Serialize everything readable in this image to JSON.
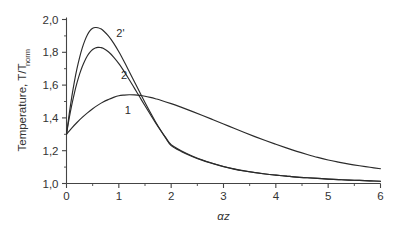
{
  "chart_data": {
    "type": "line",
    "title": "",
    "xlabel": "αz",
    "ylabel": "Temperature, T/T",
    "ylabel_subscript": "norm",
    "xlim": [
      0,
      6
    ],
    "ylim": [
      1.0,
      2.0
    ],
    "grid": false,
    "legend": "inline-curve-labels",
    "x_ticks": [
      "0",
      "1",
      "2",
      "3",
      "4",
      "5",
      "6"
    ],
    "x_tick_values": [
      0,
      1,
      2,
      3,
      4,
      5,
      6
    ],
    "x_minor_tick_values": [
      0.5,
      1.5,
      2.5,
      3.5,
      4.5,
      5.5
    ],
    "y_ticks": [
      "1,0",
      "1,2",
      "1,4",
      "1,6",
      "1,8",
      "2,0"
    ],
    "y_tick_values": [
      1.0,
      1.2,
      1.4,
      1.6,
      1.8,
      2.0
    ],
    "y_minor_tick_values": [
      1.1,
      1.3,
      1.5,
      1.7,
      1.9
    ],
    "series": [
      {
        "name": "1",
        "label": "1",
        "label_x": 1.17,
        "label_y": 1.425,
        "peak_x": 1.05,
        "peak_y": 1.54,
        "start_y": 1.3,
        "end_y": 1.09,
        "x": [
          0.0,
          0.1,
          0.2,
          0.3,
          0.4,
          0.5,
          0.6,
          0.7,
          0.8,
          0.9,
          1.0,
          1.1,
          1.2,
          1.3,
          1.4,
          1.5,
          1.6,
          1.7,
          1.8,
          2.0,
          2.2,
          2.4,
          2.6,
          2.8,
          3.0,
          3.2,
          3.4,
          3.6,
          3.8,
          4.0,
          4.2,
          4.4,
          4.6,
          4.8,
          5.0,
          5.2,
          5.4,
          5.6,
          5.8,
          6.0
        ],
        "y": [
          1.3,
          1.338,
          1.372,
          1.403,
          1.431,
          1.456,
          1.478,
          1.497,
          1.512,
          1.525,
          1.535,
          1.539,
          1.541,
          1.54,
          1.537,
          1.532,
          1.525,
          1.517,
          1.508,
          1.487,
          1.464,
          1.44,
          1.415,
          1.389,
          1.363,
          1.337,
          1.311,
          1.286,
          1.262,
          1.239,
          1.217,
          1.196,
          1.177,
          1.159,
          1.143,
          1.13,
          1.118,
          1.108,
          1.099,
          1.09
        ]
      },
      {
        "name": "2",
        "label": "2",
        "label_x": 1.1,
        "label_y": 1.635,
        "peak_x": 0.58,
        "peak_y": 1.83,
        "start_y": 1.3,
        "end_y": 1.01,
        "x": [
          0.0,
          0.05,
          0.1,
          0.15,
          0.2,
          0.25,
          0.3,
          0.35,
          0.4,
          0.45,
          0.5,
          0.55,
          0.6,
          0.65,
          0.7,
          0.8,
          0.9,
          1.0,
          1.1,
          1.2,
          1.3,
          1.4,
          1.5,
          1.6,
          1.7,
          1.8,
          1.9,
          2.0,
          2.2,
          2.4,
          2.6,
          2.8,
          3.0,
          3.2,
          3.4,
          3.6,
          3.8,
          4.0,
          4.2,
          4.4,
          4.6,
          4.8,
          5.0,
          5.2,
          5.4,
          5.6,
          5.8,
          6.0
        ],
        "y": [
          1.3,
          1.395,
          1.478,
          1.55,
          1.613,
          1.667,
          1.712,
          1.749,
          1.779,
          1.801,
          1.817,
          1.826,
          1.83,
          1.829,
          1.824,
          1.803,
          1.771,
          1.731,
          1.684,
          1.633,
          1.58,
          1.527,
          1.474,
          1.422,
          1.371,
          1.323,
          1.278,
          1.236,
          1.198,
          1.168,
          1.143,
          1.122,
          1.104,
          1.089,
          1.077,
          1.067,
          1.058,
          1.051,
          1.045,
          1.039,
          1.035,
          1.031,
          1.027,
          1.024,
          1.021,
          1.019,
          1.016,
          1.014
        ]
      },
      {
        "name": "2'",
        "label": "2'",
        "label_x": 1.03,
        "label_y": 1.895,
        "peak_x": 0.58,
        "peak_y": 1.95,
        "start_y": 1.3,
        "end_y": 1.01,
        "x": [
          0.0,
          0.05,
          0.1,
          0.15,
          0.2,
          0.25,
          0.3,
          0.35,
          0.4,
          0.45,
          0.5,
          0.55,
          0.6,
          0.65,
          0.7,
          0.8,
          0.9,
          1.0,
          1.1,
          1.2,
          1.3,
          1.4,
          1.5,
          1.6,
          1.7,
          1.8,
          1.9,
          2.0,
          2.2,
          2.4,
          2.6,
          2.8,
          3.0,
          3.2,
          3.4,
          3.6,
          3.8,
          4.0,
          4.2,
          4.4,
          4.6,
          4.8,
          5.0,
          5.2,
          5.4,
          5.6,
          5.8,
          6.0
        ],
        "y": [
          1.3,
          1.42,
          1.527,
          1.62,
          1.7,
          1.768,
          1.825,
          1.871,
          1.907,
          1.932,
          1.946,
          1.951,
          1.95,
          1.944,
          1.933,
          1.9,
          1.856,
          1.803,
          1.744,
          1.682,
          1.619,
          1.556,
          1.494,
          1.434,
          1.377,
          1.324,
          1.275,
          1.231,
          1.194,
          1.165,
          1.141,
          1.121,
          1.103,
          1.088,
          1.076,
          1.066,
          1.058,
          1.051,
          1.045,
          1.039,
          1.035,
          1.031,
          1.027,
          1.024,
          1.021,
          1.019,
          1.016,
          1.014
        ]
      }
    ]
  },
  "colors": {
    "curve": "#2b2b2b",
    "axis": "#444444",
    "text": "#333333",
    "background": "#ffffff"
  }
}
